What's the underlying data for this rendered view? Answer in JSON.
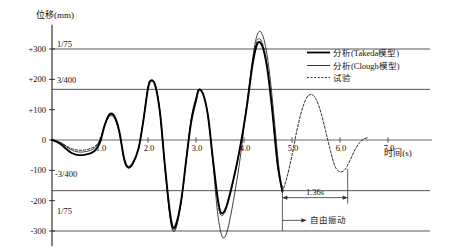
{
  "chart_data": {
    "type": "line",
    "title": "",
    "xlabel": "时间(s)",
    "ylabel": "位移(mm)",
    "xlim": [
      0,
      7.4
    ],
    "ylim": [
      -360,
      380
    ],
    "grid": true,
    "xticks": [
      "1.0",
      "2.0",
      "3.0",
      "4.0",
      "5.0",
      "6.0",
      "7.0"
    ],
    "xtick_values": [
      1.0,
      2.0,
      3.0,
      4.0,
      5.0,
      6.0,
      7.0
    ],
    "yticks": [
      "+300",
      "+200",
      "+100",
      "0",
      "-100",
      "-200",
      "-300"
    ],
    "ytick_values": [
      300,
      200,
      100,
      0,
      -100,
      -200,
      -300
    ],
    "reference_lines": [
      {
        "label": "1/75",
        "value": 300
      },
      {
        "label": "3/400",
        "value": 167
      },
      {
        "label": "-3/400",
        "value": -167
      },
      {
        "label": "1/75",
        "value": -300
      }
    ],
    "legend_position": "top-right",
    "legend": [
      {
        "name": "分析(Takeda模型)",
        "style": "solid-thick",
        "color": "#000000"
      },
      {
        "name": "分析(Clough模型)",
        "style": "solid-thin",
        "color": "#000000"
      },
      {
        "name": "试验",
        "style": "dashed",
        "color": "#000000"
      }
    ],
    "annotations": [
      {
        "text": "1.36s",
        "type": "span-arrow",
        "x_from": 4.8,
        "x_to": 6.16,
        "y": -190
      },
      {
        "text": "自由振动",
        "type": "arrow-label",
        "x_from": 4.8,
        "y": -265
      }
    ],
    "series": [
      {
        "name": "分析(Takeda模型)",
        "style": "solid-thick",
        "points": [
          [
            0.0,
            0
          ],
          [
            0.1,
            -6
          ],
          [
            0.2,
            -16
          ],
          [
            0.3,
            -30
          ],
          [
            0.4,
            -42
          ],
          [
            0.5,
            -48
          ],
          [
            0.6,
            -50
          ],
          [
            0.7,
            -48
          ],
          [
            0.8,
            -44
          ],
          [
            0.9,
            -34
          ],
          [
            1.0,
            -8
          ],
          [
            1.1,
            50
          ],
          [
            1.2,
            85
          ],
          [
            1.3,
            78
          ],
          [
            1.4,
            30
          ],
          [
            1.5,
            -60
          ],
          [
            1.58,
            -90
          ],
          [
            1.68,
            -78
          ],
          [
            1.8,
            -30
          ],
          [
            1.9,
            60
          ],
          [
            2.0,
            170
          ],
          [
            2.06,
            195
          ],
          [
            2.15,
            180
          ],
          [
            2.25,
            90
          ],
          [
            2.35,
            -80
          ],
          [
            2.45,
            -230
          ],
          [
            2.52,
            -288
          ],
          [
            2.6,
            -270
          ],
          [
            2.7,
            -190
          ],
          [
            2.8,
            -60
          ],
          [
            2.9,
            60
          ],
          [
            3.0,
            130
          ],
          [
            3.06,
            165
          ],
          [
            3.15,
            150
          ],
          [
            3.25,
            80
          ],
          [
            3.35,
            -60
          ],
          [
            3.45,
            -190
          ],
          [
            3.52,
            -240
          ],
          [
            3.62,
            -225
          ],
          [
            3.75,
            -150
          ],
          [
            3.9,
            -40
          ],
          [
            4.05,
            100
          ],
          [
            4.18,
            250
          ],
          [
            4.28,
            318
          ],
          [
            4.38,
            310
          ],
          [
            4.48,
            240
          ],
          [
            4.58,
            110
          ],
          [
            4.7,
            -80
          ],
          [
            4.8,
            -170
          ]
        ]
      },
      {
        "name": "分析(Clough模型)",
        "style": "solid-thin",
        "points": [
          [
            0.0,
            0
          ],
          [
            0.1,
            -4
          ],
          [
            0.2,
            -11
          ],
          [
            0.3,
            -22
          ],
          [
            0.4,
            -32
          ],
          [
            0.5,
            -38
          ],
          [
            0.6,
            -40
          ],
          [
            0.7,
            -38
          ],
          [
            0.8,
            -34
          ],
          [
            0.9,
            -24
          ],
          [
            1.0,
            0
          ],
          [
            1.1,
            52
          ],
          [
            1.2,
            82
          ],
          [
            1.3,
            74
          ],
          [
            1.4,
            26
          ],
          [
            1.5,
            -64
          ],
          [
            1.58,
            -92
          ],
          [
            1.68,
            -80
          ],
          [
            1.8,
            -30
          ],
          [
            1.9,
            64
          ],
          [
            2.0,
            175
          ],
          [
            2.06,
            198
          ],
          [
            2.15,
            182
          ],
          [
            2.25,
            88
          ],
          [
            2.35,
            -90
          ],
          [
            2.45,
            -245
          ],
          [
            2.52,
            -300
          ],
          [
            2.6,
            -282
          ],
          [
            2.7,
            -196
          ],
          [
            2.8,
            -62
          ],
          [
            2.9,
            72
          ],
          [
            3.0,
            140
          ],
          [
            3.06,
            168
          ],
          [
            3.15,
            152
          ],
          [
            3.25,
            78
          ],
          [
            3.35,
            -70
          ],
          [
            3.45,
            -240
          ],
          [
            3.55,
            -320
          ],
          [
            3.65,
            -300
          ],
          [
            3.78,
            -200
          ],
          [
            3.92,
            -60
          ],
          [
            4.06,
            120
          ],
          [
            4.2,
            290
          ],
          [
            4.3,
            355
          ],
          [
            4.4,
            340
          ],
          [
            4.5,
            260
          ],
          [
            4.6,
            120
          ],
          [
            4.72,
            -80
          ],
          [
            4.8,
            -170
          ]
        ]
      },
      {
        "name": "试验",
        "style": "dashed",
        "points": [
          [
            0.0,
            0
          ],
          [
            0.1,
            -4
          ],
          [
            0.2,
            -10
          ],
          [
            0.3,
            -20
          ],
          [
            0.4,
            -28
          ],
          [
            0.5,
            -32
          ],
          [
            0.6,
            -34
          ],
          [
            0.7,
            -32
          ],
          [
            0.8,
            -28
          ],
          [
            0.9,
            -20
          ],
          [
            1.0,
            0
          ],
          [
            1.1,
            48
          ],
          [
            1.2,
            78
          ],
          [
            1.3,
            72
          ],
          [
            1.4,
            24
          ],
          [
            1.5,
            -58
          ],
          [
            1.58,
            -86
          ],
          [
            1.68,
            -74
          ],
          [
            1.8,
            -28
          ],
          [
            1.9,
            62
          ],
          [
            2.0,
            172
          ],
          [
            2.06,
            196
          ],
          [
            2.15,
            184
          ],
          [
            2.25,
            92
          ],
          [
            2.35,
            -80
          ],
          [
            2.45,
            -238
          ],
          [
            2.52,
            -294
          ],
          [
            2.6,
            -278
          ],
          [
            2.7,
            -192
          ],
          [
            2.8,
            -60
          ],
          [
            2.9,
            66
          ],
          [
            3.0,
            136
          ],
          [
            3.06,
            166
          ],
          [
            3.15,
            152
          ],
          [
            3.25,
            80
          ],
          [
            3.35,
            -62
          ],
          [
            3.45,
            -200
          ],
          [
            3.52,
            -248
          ],
          [
            3.62,
            -232
          ],
          [
            3.75,
            -155
          ],
          [
            3.9,
            -42
          ],
          [
            4.05,
            105
          ],
          [
            4.18,
            260
          ],
          [
            4.28,
            330
          ],
          [
            4.38,
            320
          ],
          [
            4.48,
            248
          ],
          [
            4.58,
            114
          ],
          [
            4.7,
            -84
          ],
          [
            4.8,
            -172
          ]
        ]
      },
      {
        "name": "试验-自由振动",
        "style": "dashed",
        "points": [
          [
            4.8,
            -172
          ],
          [
            4.9,
            -120
          ],
          [
            5.0,
            -50
          ],
          [
            5.1,
            30
          ],
          [
            5.2,
            95
          ],
          [
            5.3,
            138
          ],
          [
            5.4,
            150
          ],
          [
            5.5,
            135
          ],
          [
            5.6,
            92
          ],
          [
            5.7,
            30
          ],
          [
            5.8,
            -35
          ],
          [
            5.9,
            -88
          ],
          [
            6.0,
            -105
          ],
          [
            6.1,
            -98
          ],
          [
            6.2,
            -70
          ],
          [
            6.3,
            -36
          ],
          [
            6.4,
            -10
          ],
          [
            6.5,
            4
          ],
          [
            6.6,
            8
          ]
        ]
      }
    ]
  },
  "legend_items": [
    {
      "label": "分析(Takeda模型)"
    },
    {
      "label": "分析(Clough模型)"
    },
    {
      "label": "试验"
    }
  ],
  "axes": {
    "y_title": "位移(mm)",
    "x_title": "时间(s)",
    "y_ticks": [
      "+300",
      "+200",
      "+100",
      "0",
      "-100",
      "-200",
      "-300"
    ],
    "x_ticks": [
      "1.0",
      "2.0",
      "3.0",
      "4.0",
      "5.0",
      "6.0",
      "7.0"
    ]
  },
  "reference_labels": {
    "top": "1/75",
    "upper_mid": "3/400",
    "lower_mid": "-3/400",
    "bottom": "1/75"
  },
  "annotations": {
    "duration": "1.36s",
    "free_vibration": "自由振动"
  }
}
